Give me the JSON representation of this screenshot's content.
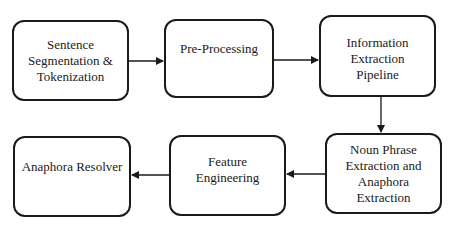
{
  "diagram": {
    "type": "flowchart",
    "colors": {
      "stroke": "#1a1a1a",
      "background": "#ffffff",
      "text": "#1a1a1a"
    },
    "nodes": [
      {
        "id": "n1",
        "label": "Sentence\nSegmentation &\nTokenization"
      },
      {
        "id": "n2",
        "label": "Pre-Processing"
      },
      {
        "id": "n3",
        "label": "Information\nExtraction\nPipeline"
      },
      {
        "id": "n4",
        "label": "Noun Phrase\nExtraction and\nAnaphora\nExtraction"
      },
      {
        "id": "n5",
        "label": "Feature\nEngineering"
      },
      {
        "id": "n6",
        "label": "Anaphora Resolver"
      }
    ],
    "edges": [
      {
        "from": "n1",
        "to": "n2"
      },
      {
        "from": "n2",
        "to": "n3"
      },
      {
        "from": "n3",
        "to": "n4"
      },
      {
        "from": "n4",
        "to": "n5"
      },
      {
        "from": "n5",
        "to": "n6"
      }
    ]
  }
}
